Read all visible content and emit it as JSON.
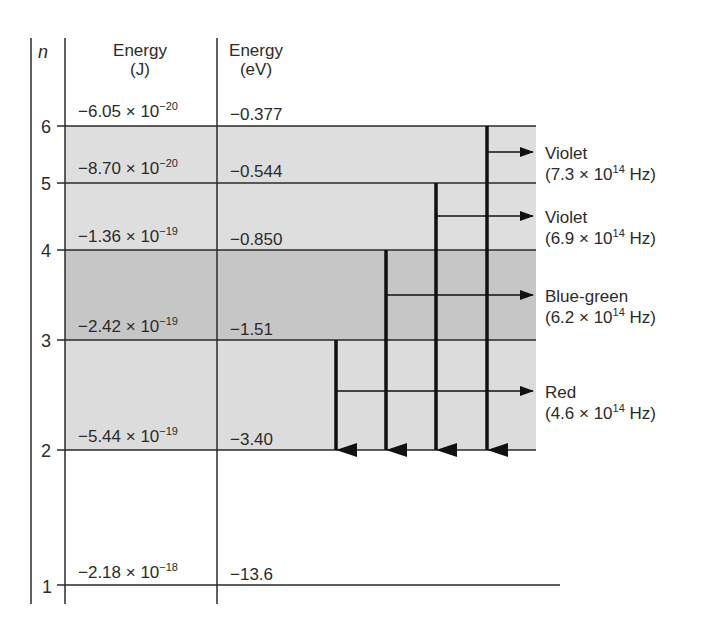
{
  "diagram": {
    "headers": {
      "n": "n",
      "energy_j_line1": "Energy",
      "energy_j_line2": "(J)",
      "energy_ev_line1": "Energy",
      "energy_ev_line2": "(eV)"
    },
    "levels": [
      {
        "n": "6",
        "energy_j_mantissa": "−6.05 × 10",
        "energy_j_exp": "−20",
        "energy_ev": "−0.377"
      },
      {
        "n": "5",
        "energy_j_mantissa": "−8.70 × 10",
        "energy_j_exp": "−20",
        "energy_ev": "−0.544"
      },
      {
        "n": "4",
        "energy_j_mantissa": "−1.36 × 10",
        "energy_j_exp": "−19",
        "energy_ev": "−0.850"
      },
      {
        "n": "3",
        "energy_j_mantissa": "−2.42 × 10",
        "energy_j_exp": "−19",
        "energy_ev": "−1.51"
      },
      {
        "n": "2",
        "energy_j_mantissa": "−5.44 × 10",
        "energy_j_exp": "−19",
        "energy_ev": "−3.40"
      },
      {
        "n": "1",
        "energy_j_mantissa": "−2.18 × 10",
        "energy_j_exp": "−18",
        "energy_ev": "−13.6"
      }
    ],
    "transitions": [
      {
        "from": 6,
        "to": 2,
        "color_name": "Violet",
        "freq_mantissa": "(7.3 × 10",
        "freq_exp": "14",
        "freq_unit": " Hz)"
      },
      {
        "from": 5,
        "to": 2,
        "color_name": "Violet",
        "freq_mantissa": "(6.9 × 10",
        "freq_exp": "14",
        "freq_unit": " Hz)"
      },
      {
        "from": 4,
        "to": 2,
        "color_name": "Blue-green",
        "freq_mantissa": "(6.2 × 10",
        "freq_exp": "14",
        "freq_unit": " Hz)"
      },
      {
        "from": 3,
        "to": 2,
        "color_name": "Red",
        "freq_mantissa": "(4.6 × 10",
        "freq_exp": "14",
        "freq_unit": " Hz)"
      }
    ],
    "colors": {
      "line": "#2a2a2a",
      "shade_light": "#dedede",
      "shade_dark": "#c6c6c6",
      "arrow": "#111111"
    }
  }
}
